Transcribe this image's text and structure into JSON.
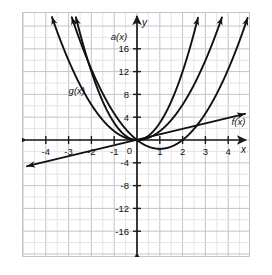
{
  "chart_data": {
    "type": "line",
    "title": "",
    "xlabel": "x",
    "ylabel": "y",
    "xlim": [
      -5,
      5
    ],
    "ylim": [
      -19,
      19
    ],
    "grid": true,
    "grid_minor_step_x": 0.5,
    "grid_major_step_x": 1,
    "grid_minor_step_y": 2,
    "grid_major_step_y": 4,
    "legend_position": "inline-labels",
    "x_tick_labels": [
      "-4",
      "-3",
      "-2",
      "-1",
      "0",
      "1",
      "2",
      "3",
      "4"
    ],
    "x_tick_values": [
      -4,
      -3,
      -2,
      -1,
      0,
      1,
      2,
      3,
      4
    ],
    "y_tick_labels": [
      "16",
      "12",
      "8",
      "4",
      "-4",
      "-8",
      "-12",
      "-16"
    ],
    "y_tick_values": [
      16,
      12,
      8,
      4,
      -4,
      -8,
      -12,
      -16
    ],
    "origin_label": "0",
    "series": [
      {
        "name": "g(x)",
        "label": "g(x)",
        "kind": "parabola",
        "equation": "y = 1.55 x^2",
        "a": 1.55,
        "h": 0,
        "k": 0,
        "label_x": -3.0,
        "label_y": 8.0,
        "color": "#111111"
      },
      {
        "name": "a(x)",
        "label": "a(x)",
        "kind": "parabola",
        "equation": "y = 3.0 x^2",
        "a": 3.0,
        "h": 0,
        "k": 0,
        "label_x": -1.15,
        "label_y": 17.5,
        "color": "#111111"
      },
      {
        "name": "h(x)",
        "label": "",
        "kind": "parabola",
        "equation": "y = 1.55 (x - 1)^2 - 1.55",
        "a": 1.55,
        "h": 1,
        "k": -1.55,
        "label_x": null,
        "label_y": null,
        "color": "#111111"
      },
      {
        "name": "f(x)",
        "label": "f(x)",
        "kind": "line",
        "equation": "y = 0.9 x",
        "slope": 0.9,
        "intercept": 0,
        "label_x": 4.15,
        "label_y": 2.55,
        "color": "#111111"
      }
    ],
    "axis_arrows": [
      "up",
      "down",
      "left",
      "right"
    ],
    "colors": {
      "curve": "#111111",
      "axis": "#1a1a1a",
      "grid_minor": "#e3e3e8",
      "grid_major": "#c3c3cc",
      "background": "#ffffff",
      "text": "#111111"
    }
  },
  "axis_labels": {
    "x_axis_name": "x",
    "y_axis_name": "y"
  }
}
